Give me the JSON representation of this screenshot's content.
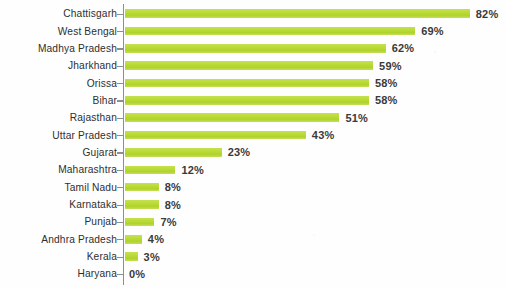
{
  "chart_data": {
    "type": "bar",
    "orientation": "horizontal",
    "title": "",
    "subtitle": "",
    "xlabel": "",
    "ylabel": "",
    "xlim": [
      0,
      82
    ],
    "grid": false,
    "legend": null,
    "value_suffix": "%",
    "bar_color": "#b8da33",
    "label_color": "#2f2f2f",
    "value_label_color": "#3a3a3a",
    "axis_color": "#8e8e8e",
    "background_color": "#ffffff",
    "categories": [
      "Chattisgarh",
      "West Bengal",
      "Madhya Pradesh",
      "Jharkhand",
      "Orissa",
      "Bihar",
      "Rajasthan",
      "Uttar Pradesh",
      "Gujarat",
      "Maharashtra",
      "Tamil Nadu",
      "Karnataka",
      "Punjab",
      "Andhra Pradesh",
      "Kerala",
      "Haryana"
    ],
    "values": [
      82,
      69,
      62,
      59,
      58,
      58,
      51,
      43,
      23,
      12,
      8,
      8,
      7,
      4,
      3,
      0
    ],
    "value_labels": [
      "82%",
      "69%",
      "62%",
      "59%",
      "58%",
      "58%",
      "51%",
      "43%",
      "23%",
      "12%",
      "8%",
      "8%",
      "7%",
      "4%",
      "3%",
      "0%"
    ]
  }
}
